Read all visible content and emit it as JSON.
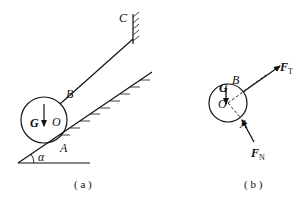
{
  "figure_a": {
    "caption": "( a )",
    "labels": {
      "C": "C",
      "B": "B",
      "G": "G",
      "O": "O",
      "A": "A",
      "alpha": "α"
    }
  },
  "figure_b": {
    "caption": "( b )",
    "labels": {
      "G": "G",
      "O": "O",
      "B": "B",
      "A": "A",
      "FT": "F",
      "FT_sub": "T",
      "FN": "F",
      "FN_sub": "N"
    }
  },
  "colors": {
    "ink": "#111111",
    "background": "#ffffff"
  }
}
